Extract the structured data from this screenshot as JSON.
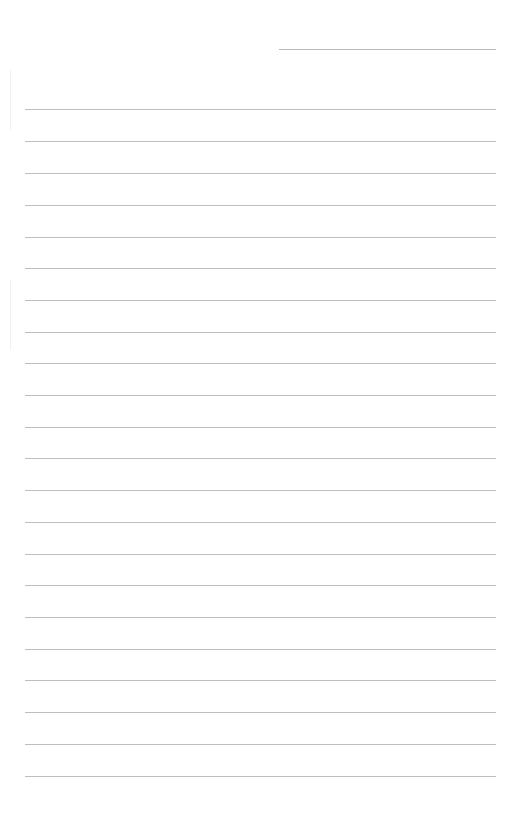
{
  "document": {
    "type": "lined-paper",
    "background_color": "#ffffff",
    "line_color": "#bdbdbd",
    "header_line": {
      "x": 279,
      "y": 49,
      "width": 217
    },
    "ruled_lines": {
      "count": 22,
      "x": 25,
      "width": 471,
      "positions_y": [
        109,
        141,
        173,
        205,
        237,
        268,
        300,
        332,
        363,
        395,
        427,
        458,
        490,
        522,
        554,
        585,
        617,
        649,
        680,
        712,
        744,
        776
      ]
    },
    "text_content": []
  }
}
